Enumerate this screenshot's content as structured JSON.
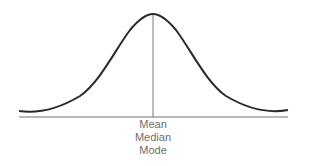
{
  "diagram": {
    "type": "normal distribution curve",
    "labels": [
      "Mean",
      "Median",
      "Mode"
    ],
    "colors": {
      "curve": "#2a2a2a",
      "baseline": "#9a9a9a",
      "center_line": "#7a7a7a",
      "label_text": "#6e6e6e"
    }
  }
}
